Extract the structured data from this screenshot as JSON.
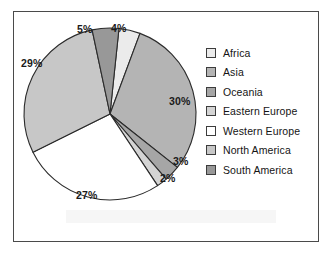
{
  "figure": {
    "frame": true,
    "background": "#ffffff"
  },
  "chart_data": {
    "type": "pie",
    "title": "",
    "subtitle": "",
    "xlabel": "",
    "ylabel": "",
    "grid": false,
    "legend_position": "right",
    "value_suffix": "%",
    "total": 100,
    "categories": [
      "Africa",
      "Asia",
      "Oceania",
      "Eastern Europe",
      "Western Europe",
      "North America",
      "South America"
    ],
    "values": [
      4,
      30,
      3,
      2,
      27,
      29,
      5
    ],
    "labels": [
      "4%",
      "30%",
      "3%",
      "2%",
      "27%",
      "29%",
      "5%"
    ],
    "colors": [
      "#ebebeb",
      "#b4b4b4",
      "#a6a6a6",
      "#d4d4d4",
      "#ffffff",
      "#c7c7c7",
      "#989898"
    ],
    "slice_border": "#2b2b2b",
    "start_angle_deg": -84,
    "slices": [
      {
        "name": "Africa",
        "value": 4,
        "label": "4%",
        "color": "#ebebeb"
      },
      {
        "name": "Asia",
        "value": 30,
        "label": "30%",
        "color": "#b4b4b4"
      },
      {
        "name": "Oceania",
        "value": 3,
        "label": "3%",
        "color": "#a6a6a6"
      },
      {
        "name": "Eastern Europe",
        "value": 2,
        "label": "2%",
        "color": "#d4d4d4"
      },
      {
        "name": "Western Europe",
        "value": 27,
        "label": "27%",
        "color": "#ffffff"
      },
      {
        "name": "North America",
        "value": 29,
        "label": "29%",
        "color": "#c7c7c7"
      },
      {
        "name": "South America",
        "value": 5,
        "label": "5%",
        "color": "#989898"
      }
    ]
  },
  "pie_labels": {
    "africa": "4%",
    "asia": "30%",
    "oceania": "3%",
    "eastern_europe": "2%",
    "western_europe": "27%",
    "north_america": "29%",
    "south_america": "5%"
  },
  "legend": {
    "items": [
      {
        "label": "Africa",
        "color": "#ebebeb"
      },
      {
        "label": "Asia",
        "color": "#b4b4b4"
      },
      {
        "label": "Oceania",
        "color": "#a6a6a6"
      },
      {
        "label": "Eastern Europe",
        "color": "#d4d4d4"
      },
      {
        "label": "Western Europe",
        "color": "#ffffff"
      },
      {
        "label": "North America",
        "color": "#c7c7c7"
      },
      {
        "label": "South America",
        "color": "#989898"
      }
    ]
  }
}
